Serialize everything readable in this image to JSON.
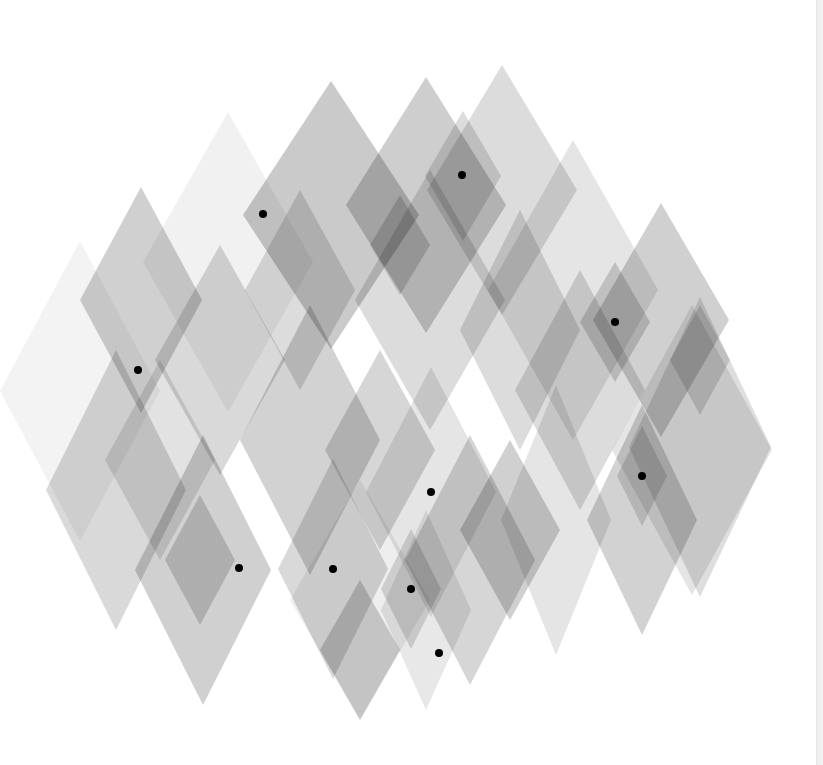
{
  "artwork": {
    "background": "#ffffff",
    "edge_strip_color": "#f1f1f1",
    "diamond_fill": "#8a8a8a",
    "dot_color": "#000000",
    "dot_radius": 4,
    "diamonds": [
      {
        "cx": 228,
        "cy": 262,
        "w": 170,
        "h": 300,
        "o": 0.12
      },
      {
        "cx": 80,
        "cy": 391,
        "w": 160,
        "h": 300,
        "o": 0.1
      },
      {
        "cx": 141,
        "cy": 300,
        "w": 122,
        "h": 226,
        "o": 0.4
      },
      {
        "cx": 331,
        "cy": 215,
        "w": 176,
        "h": 268,
        "o": 0.45
      },
      {
        "cx": 426,
        "cy": 205,
        "w": 160,
        "h": 256,
        "o": 0.42
      },
      {
        "cx": 502,
        "cy": 190,
        "w": 150,
        "h": 250,
        "o": 0.3
      },
      {
        "cx": 573,
        "cy": 290,
        "w": 170,
        "h": 300,
        "o": 0.22
      },
      {
        "cx": 661,
        "cy": 320,
        "w": 136,
        "h": 234,
        "o": 0.4
      },
      {
        "cx": 700,
        "cy": 447,
        "w": 142,
        "h": 300,
        "o": 0.28
      },
      {
        "cx": 463,
        "cy": 176,
        "w": 76,
        "h": 130,
        "o": 0.3
      },
      {
        "cx": 400,
        "cy": 245,
        "w": 60,
        "h": 100,
        "o": 0.35
      },
      {
        "cx": 300,
        "cy": 290,
        "w": 110,
        "h": 200,
        "o": 0.3
      },
      {
        "cx": 220,
        "cy": 360,
        "w": 130,
        "h": 230,
        "o": 0.32
      },
      {
        "cx": 430,
        "cy": 300,
        "w": 150,
        "h": 260,
        "o": 0.3
      },
      {
        "cx": 520,
        "cy": 330,
        "w": 120,
        "h": 240,
        "o": 0.3
      },
      {
        "cx": 615,
        "cy": 322,
        "w": 70,
        "h": 120,
        "o": 0.35
      },
      {
        "cx": 700,
        "cy": 360,
        "w": 60,
        "h": 110,
        "o": 0.3
      },
      {
        "cx": 116,
        "cy": 490,
        "w": 140,
        "h": 280,
        "o": 0.32
      },
      {
        "cx": 160,
        "cy": 460,
        "w": 110,
        "h": 200,
        "o": 0.25
      },
      {
        "cx": 203,
        "cy": 570,
        "w": 136,
        "h": 270,
        "o": 0.4
      },
      {
        "cx": 200,
        "cy": 560,
        "w": 70,
        "h": 130,
        "o": 0.35
      },
      {
        "cx": 310,
        "cy": 440,
        "w": 140,
        "h": 270,
        "o": 0.38
      },
      {
        "cx": 360,
        "cy": 600,
        "w": 140,
        "h": 240,
        "o": 0.15
      },
      {
        "cx": 333,
        "cy": 569,
        "w": 110,
        "h": 220,
        "o": 0.32
      },
      {
        "cx": 380,
        "cy": 450,
        "w": 110,
        "h": 200,
        "o": 0.35
      },
      {
        "cx": 431,
        "cy": 492,
        "w": 130,
        "h": 250,
        "o": 0.22
      },
      {
        "cx": 360,
        "cy": 650,
        "w": 80,
        "h": 140,
        "o": 0.38
      },
      {
        "cx": 411,
        "cy": 589,
        "w": 60,
        "h": 120,
        "o": 0.3
      },
      {
        "cx": 426,
        "cy": 610,
        "w": 90,
        "h": 200,
        "o": 0.2
      },
      {
        "cx": 470,
        "cy": 560,
        "w": 130,
        "h": 250,
        "o": 0.35
      },
      {
        "cx": 510,
        "cy": 530,
        "w": 100,
        "h": 180,
        "o": 0.4
      },
      {
        "cx": 556,
        "cy": 520,
        "w": 110,
        "h": 270,
        "o": 0.22
      },
      {
        "cx": 580,
        "cy": 390,
        "w": 130,
        "h": 240,
        "o": 0.3
      },
      {
        "cx": 642,
        "cy": 520,
        "w": 110,
        "h": 230,
        "o": 0.38
      },
      {
        "cx": 642,
        "cy": 476,
        "w": 50,
        "h": 100,
        "o": 0.3
      },
      {
        "cx": 692,
        "cy": 450,
        "w": 160,
        "h": 290,
        "o": 0.22
      }
    ],
    "dots": [
      {
        "x": 263,
        "y": 214
      },
      {
        "x": 462,
        "y": 175
      },
      {
        "x": 615,
        "y": 322
      },
      {
        "x": 138,
        "y": 370
      },
      {
        "x": 642,
        "y": 476
      },
      {
        "x": 431,
        "y": 492
      },
      {
        "x": 239,
        "y": 568
      },
      {
        "x": 333,
        "y": 569
      },
      {
        "x": 411,
        "y": 589
      },
      {
        "x": 439,
        "y": 653
      }
    ]
  }
}
